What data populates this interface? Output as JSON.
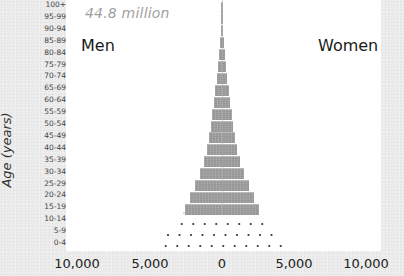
{
  "chart_data": {
    "type": "bar",
    "subtype": "population-pyramid",
    "title": "",
    "subtitle": "44.8 million",
    "xlabel": "",
    "ylabel": "Age (years)",
    "legend": {
      "left": "Men",
      "right": "Women"
    },
    "x_ticks": [
      "10,000",
      "5,000",
      "0",
      "5,000",
      "10,000"
    ],
    "xlim": [
      -10000,
      10000
    ],
    "categories": [
      "100+",
      "95-99",
      "90-94",
      "85-89",
      "80-84",
      "75-79",
      "70-74",
      "65-69",
      "60-64",
      "55-59",
      "50-54",
      "45-49",
      "40-44",
      "35-39",
      "30-34",
      "25-29",
      "20-24",
      "15-19",
      "10-14",
      "5-9",
      "0-4"
    ],
    "series": [
      {
        "name": "Men",
        "style": "solid-gray",
        "values": [
          5,
          20,
          60,
          130,
          220,
          300,
          380,
          470,
          560,
          660,
          780,
          900,
          1050,
          1250,
          1550,
          1900,
          2250,
          2600,
          null,
          null,
          null
        ]
      },
      {
        "name": "Women",
        "style": "solid-gray",
        "values": [
          5,
          20,
          60,
          130,
          220,
          300,
          380,
          470,
          560,
          660,
          780,
          900,
          1050,
          1250,
          1550,
          1900,
          2250,
          2600,
          null,
          null,
          null
        ]
      },
      {
        "name": "Men (projected/births, dotted)",
        "style": "dotted",
        "values": [
          null,
          null,
          null,
          null,
          null,
          null,
          null,
          null,
          null,
          null,
          null,
          null,
          null,
          null,
          null,
          null,
          null,
          null,
          2700,
          3200,
          3800
        ]
      },
      {
        "name": "Women (projected/births, dotted)",
        "style": "dotted",
        "values": [
          null,
          null,
          null,
          null,
          null,
          null,
          null,
          null,
          null,
          null,
          null,
          null,
          null,
          null,
          null,
          null,
          null,
          null,
          2700,
          3200,
          3800
        ]
      }
    ],
    "units": "thousands",
    "grid": false
  },
  "labels": {
    "subtitle": "44.8 million",
    "men": "Men",
    "women": "Women",
    "y_axis_title": "Age (years)"
  },
  "colors": {
    "bar": "#9e9e9e",
    "background": "#ebebeb",
    "plot": "#ffffff"
  }
}
